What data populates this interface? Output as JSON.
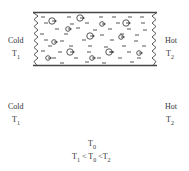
{
  "figure": {
    "top_slab": {
      "left_label": "Cold",
      "left_temp": "T",
      "left_temp_sub": "1",
      "right_label": "Hot",
      "right_temp": "T",
      "right_temp_sub": "2",
      "particle_direction": "right"
    },
    "bottom_slab": {
      "left_label": "Cold",
      "left_temp": "T",
      "left_temp_sub": "1",
      "right_label": "Hot",
      "right_temp": "T",
      "right_temp_sub": "2",
      "divider_label": "T",
      "divider_label_sub": "0",
      "left_particle_direction": "right",
      "right_particle_direction": "left"
    },
    "relation": {
      "a": "T",
      "a_sub": "1",
      "op1": " < ",
      "b": "T",
      "b_sub": "0",
      "op2": " <",
      "c": "T",
      "c_sub": "2"
    },
    "colors": {
      "stroke": "#444444",
      "text": "#333333",
      "background": "#ffffff"
    }
  }
}
